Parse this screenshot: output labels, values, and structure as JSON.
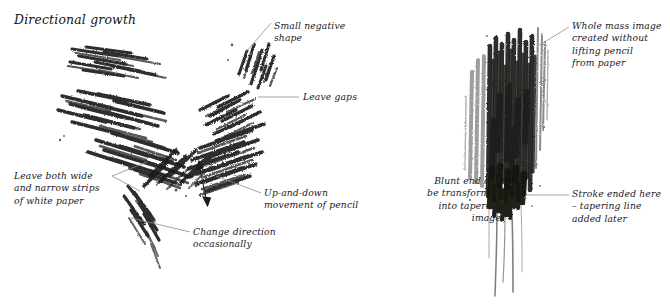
{
  "page": {
    "title": "Directional growth",
    "background_color": "#ffffff",
    "ink_color": "#20201e",
    "leader_line_color": "#8a8a88",
    "width": 670,
    "height": 305
  },
  "figures": [
    {
      "id": "figure-left",
      "name": "directional-growth-v-shape",
      "description": "Butterfly / V-shaped mass of short diagonal pencil strokes radiating outward from a centre point"
    },
    {
      "id": "figure-right",
      "name": "vertical-mass-with-tapering-tails",
      "description": "Dense vertical column of pencil strokes drawn without lifting the pencil, with long thin tapering tails trailing downward"
    }
  ],
  "annotations": [
    {
      "id": "title",
      "name": "page-title",
      "text": "Directional growth",
      "lines": [
        "Directional growth"
      ],
      "align": "left",
      "x": 14,
      "y": 12,
      "leader": null
    },
    {
      "id": "small-negative-shape",
      "name": "annotation-small-negative-shape",
      "text": "Small negative shape",
      "lines": [
        "Small negative",
        "shape"
      ],
      "align": "left",
      "x": 274,
      "y": 20,
      "leader": {
        "x1": 271,
        "y1": 23,
        "x2": 246,
        "y2": 52
      }
    },
    {
      "id": "leave-gaps",
      "name": "annotation-leave-gaps",
      "text": "Leave gaps",
      "lines": [
        "Leave gaps"
      ],
      "align": "left",
      "x": 303,
      "y": 93,
      "leader": {
        "x1": 299,
        "y1": 97,
        "x2": 258,
        "y2": 97
      }
    },
    {
      "id": "leave-strips",
      "name": "annotation-leave-wide-and-narrow-strips",
      "text": "Leave both wide and narrow strips of white paper",
      "lines": [
        "Leave both wide",
        "and narrow strips",
        "of white paper"
      ],
      "align": "left",
      "x": 14,
      "y": 170,
      "leader": {
        "x1": 112,
        "y1": 175,
        "x2": 147,
        "y2": 163
      },
      "leader2": {
        "x1": 112,
        "y1": 177,
        "x2": 139,
        "y2": 190
      }
    },
    {
      "id": "up-and-down",
      "name": "annotation-up-and-down-movement",
      "text": "Up-and-down movement of pencil",
      "lines": [
        "Up-and-down",
        "movement of pencil"
      ],
      "align": "left",
      "x": 264,
      "y": 189,
      "leader": {
        "x1": 261,
        "y1": 193,
        "x2": 216,
        "y2": 176
      }
    },
    {
      "id": "change-direction",
      "name": "annotation-change-direction",
      "text": "Change direction occasionally",
      "lines": [
        "Change direction",
        "occasionally"
      ],
      "align": "left",
      "x": 193,
      "y": 228,
      "leader": {
        "x1": 190,
        "y1": 232,
        "x2": 131,
        "y2": 218
      }
    },
    {
      "id": "whole-mass",
      "name": "annotation-whole-mass-image",
      "text": "Whole mass image created without lifting pencil from paper",
      "lines": [
        "Whole mass image",
        "created without",
        "lifting pencil",
        "from paper"
      ],
      "align": "left",
      "x": 572,
      "y": 22,
      "leader": {
        "x1": 569,
        "y1": 27,
        "x2": 538,
        "y2": 46
      }
    },
    {
      "id": "blunt-end",
      "name": "annotation-blunt-end-tapering",
      "text": "Blunt end can be transformed into tapering image",
      "lines": [
        "Blunt end can",
        "be transformed",
        "into tapering",
        "image"
      ],
      "align": "right",
      "x": 397,
      "y": 177,
      "width": 104,
      "leader": null
    },
    {
      "id": "stroke-ended",
      "name": "annotation-stroke-ended-here",
      "text": "Stroke ended here – tapering line added later",
      "lines": [
        "Stroke ended here",
        "– tapering line",
        "added later"
      ],
      "align": "left",
      "x": 572,
      "y": 190,
      "leader": {
        "x1": 569,
        "y1": 195,
        "x2": 525,
        "y2": 195
      }
    }
  ],
  "arrow": {
    "name": "up-and-down-double-arrow",
    "label": "double-headed vertical arrow",
    "x1": 198,
    "y1": 162,
    "x2": 208,
    "y2": 205
  }
}
